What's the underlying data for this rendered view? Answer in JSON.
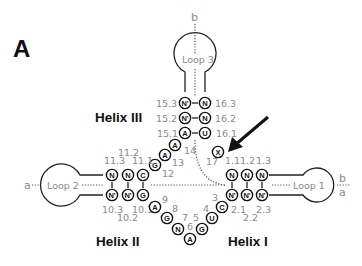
{
  "panel_label": "A",
  "helices": {
    "helix1": "Helix I",
    "helix2": "Helix II",
    "helix3": "Helix III"
  },
  "loops": {
    "loop1": "Loop 1",
    "loop2": "Loop 2",
    "loop3": "Loop 3"
  },
  "ends": {
    "loop3_top": "b",
    "loop2_left": "a",
    "loop1_right_top": "b",
    "loop1_right_bottom": "a"
  },
  "nucleotides": {
    "n15_3": "N'",
    "n16_3": "N",
    "n15_2": "N'",
    "n16_2": "N",
    "n15_1": "A",
    "n16_1": "U",
    "n14": "A",
    "n13": "A",
    "n12": "G",
    "n17": "X",
    "n11_3": "N",
    "n11_2": "N",
    "n11_1": "C",
    "n10_3": "N'",
    "n10_2": "N'",
    "n10_1": "G",
    "n9": "A",
    "n8": "G",
    "n7": "N",
    "n6": "A",
    "n5": "G",
    "n4": "U",
    "n3": "C",
    "n1_1": "N",
    "n1_2": "N",
    "n1_3": "N",
    "n2_1": "N'",
    "n2_2": "N'",
    "n2_3": "N'"
  },
  "labels": {
    "l15_3": "15.3",
    "l16_3": "16.3",
    "l15_2": "15.2",
    "l16_2": "16.2",
    "l15_1": "15.1",
    "l16_1": "16.1",
    "l14": "14",
    "l13": "13",
    "l12": "12",
    "l17": "17",
    "l11_3": "11.3",
    "l11_2": "11.2",
    "l11_1": "11.1",
    "l10_3": "10.3",
    "l10_2": "10.2",
    "l10_1": "10.1",
    "l9": "9",
    "l8": "8",
    "l7": "7",
    "l6": "6",
    "l5": "5",
    "l4": "4",
    "l3": "3",
    "l1_1": "1.1",
    "l1_2": "1.2",
    "l1_3": "1.3",
    "l2_1": "2.1",
    "l2_2": "2.2",
    "l2_3": "2.3"
  },
  "pair_symbol": "–"
}
